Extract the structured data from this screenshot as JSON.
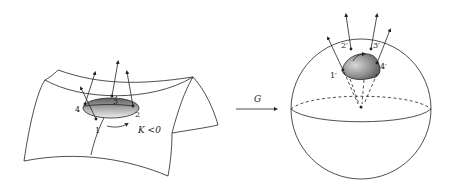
{
  "figure": {
    "left_surface": {
      "description": "saddle surface with shaded patch",
      "vertex_labels": [
        "1",
        "2",
        "3",
        "4"
      ],
      "curvature_label": "K <0"
    },
    "map_arrow": {
      "label": "G"
    },
    "right_sphere": {
      "description": "unit sphere with image patch",
      "vertex_labels": [
        "1′",
        "2′",
        "3′",
        "4′"
      ]
    },
    "colors": {
      "stroke": "#222222",
      "patch_dark": "#6e6e6e",
      "patch_light": "#e6e6e6",
      "background": "#ffffff"
    }
  }
}
